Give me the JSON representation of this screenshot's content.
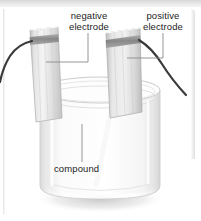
{
  "diagram": {
    "labels": {
      "negative_line1": "negative",
      "negative_line2": "electrode",
      "positive_line1": "positive",
      "positive_line2": "electrode",
      "compound": "compound"
    },
    "colors": {
      "wire": "#3a3a3a",
      "electrode_fill": "#d6d6d6",
      "electrode_band": "#8e8e8e",
      "beaker_glass": "#f2f2f2",
      "leader_line": "#8a8a8a",
      "text": "#1d1d1d",
      "panel_band": "#d8d8d8"
    },
    "parts": [
      "negative electrode",
      "positive electrode",
      "compound",
      "beaker",
      "left wire",
      "right wire"
    ]
  }
}
